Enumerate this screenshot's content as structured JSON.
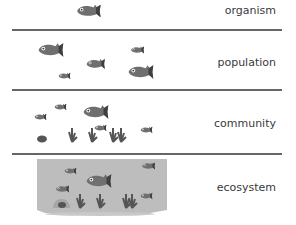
{
  "levels": [
    {
      "label": "organism",
      "fish_count": 1
    },
    {
      "label": "population",
      "fish_count": 5
    },
    {
      "label": "community",
      "fish_count": 5
    },
    {
      "label": "ecosystem",
      "fish_count": 5
    }
  ],
  "colors": {
    "fish": "#6f6f6f",
    "fish_dark": "#3f3f3f",
    "water": "#bcbcbc",
    "divider": "#666666",
    "text": "#3a3a3a"
  }
}
